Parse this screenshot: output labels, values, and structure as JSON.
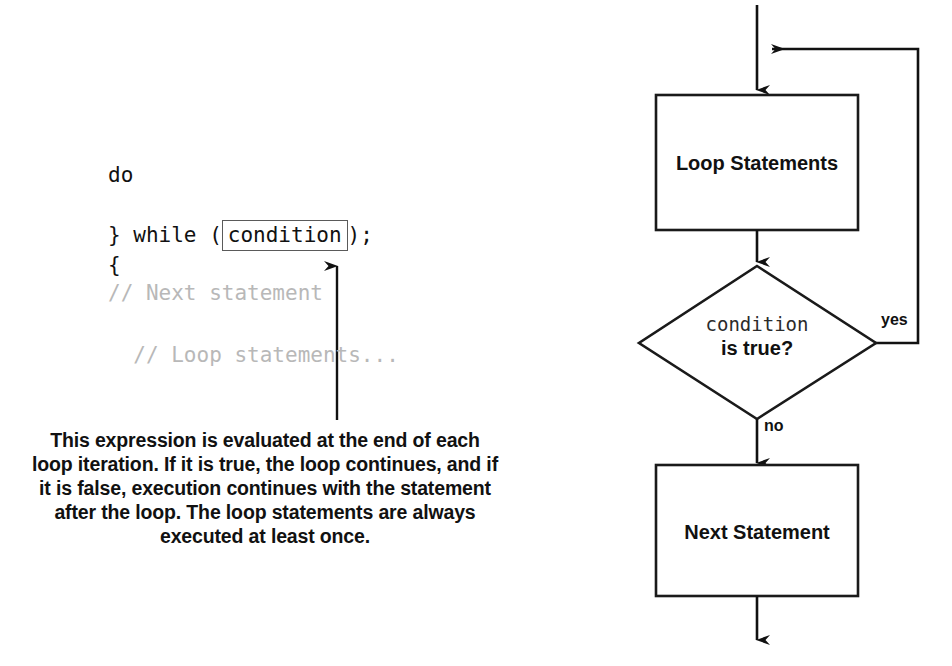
{
  "code": {
    "lines": [
      {
        "text": "do",
        "comment": false
      },
      {
        "text": "{",
        "comment": false
      },
      {
        "text": "  // Loop statements...",
        "comment": true
      }
    ],
    "while_prefix": "} while (",
    "condition": "condition",
    "while_suffix": ");",
    "next_comment": "// Next statement"
  },
  "caption": {
    "part1": "This expression is evaluated at the end of each loop iteration. If it is ",
    "true_word": "true",
    "part2": ", the loop continues, and if it is ",
    "false_word": "false",
    "part3": ", execution continues with the statement after the loop. The loop statements are always executed at least once.",
    "full_text": "This expression is evaluated at the end of each loop iteration. If it is true, the loop continues, and if it is false, execution continues with the statement after the loop. The loop statements are always executed at least once."
  },
  "flowchart": {
    "loop_statements_label": "Loop Statements",
    "next_statement_label": "Next Statement",
    "decision_condition": "condition",
    "decision_question": "is true?",
    "yes_label": "yes",
    "no_label": "no"
  },
  "colors": {
    "ink": "#111111",
    "comment_gray": "#b8b8b8",
    "box_stroke": "#1a1a1a",
    "condition_box_stroke": "#5a5a5a",
    "background": "#ffffff"
  }
}
